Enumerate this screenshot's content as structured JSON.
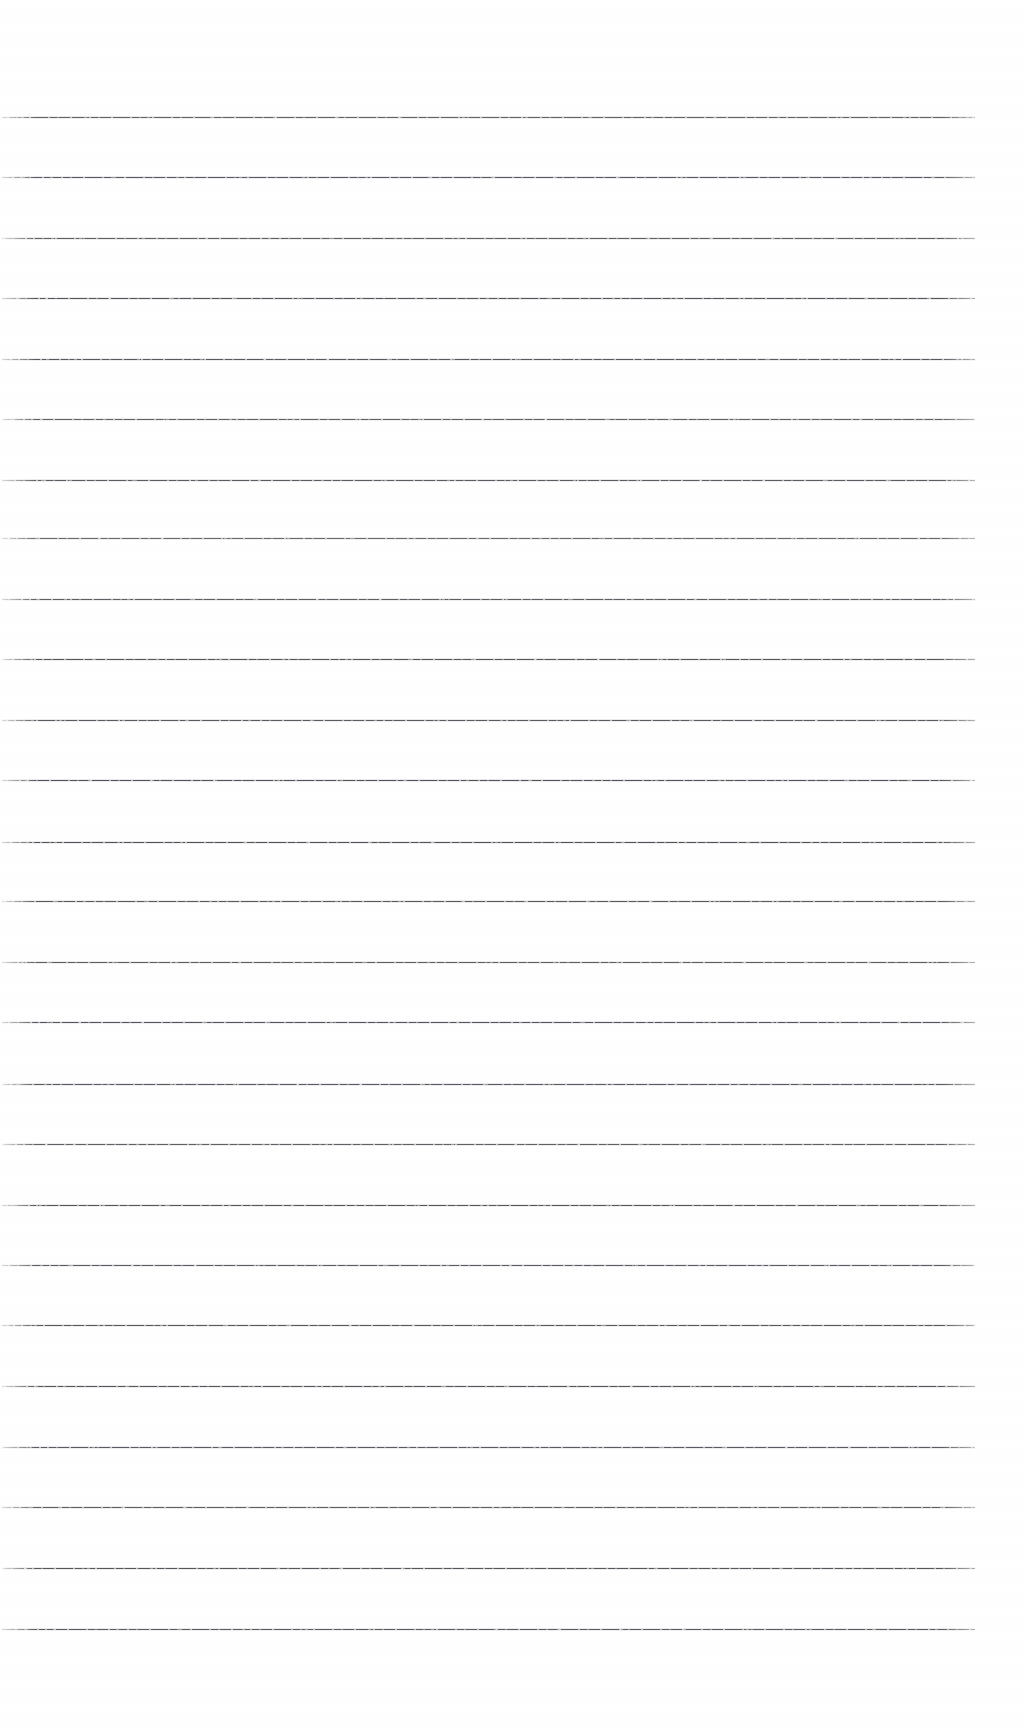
{
  "document": {
    "kind": "ruled-notebook-page",
    "content_text": "",
    "page_width": 1030,
    "page_height": 1728,
    "paper_color": "#fdfdfd",
    "rule_color": "#4d4d55"
  },
  "ruling": {
    "line_count": 26,
    "line_left_x": 2,
    "line_right_x": 975,
    "line_width": 973,
    "first_line_y": 117,
    "line_spacing": 60.5,
    "line_thickness": 1,
    "top_margin": 117,
    "bottom_margin": 99,
    "right_margin": 55,
    "left_margin": 2,
    "lines": [
      {
        "index": 1,
        "y": 117,
        "opacity": 0.88
      },
      {
        "index": 2,
        "y": 177,
        "opacity": 0.92
      },
      {
        "index": 3,
        "y": 238,
        "opacity": 0.9
      },
      {
        "index": 4,
        "y": 298,
        "opacity": 0.95
      },
      {
        "index": 5,
        "y": 359,
        "opacity": 0.93
      },
      {
        "index": 6,
        "y": 419,
        "opacity": 0.88
      },
      {
        "index": 7,
        "y": 480,
        "opacity": 0.91
      },
      {
        "index": 8,
        "y": 538,
        "opacity": 0.84
      },
      {
        "index": 9,
        "y": 599,
        "opacity": 0.9
      },
      {
        "index": 10,
        "y": 659,
        "opacity": 0.94
      },
      {
        "index": 11,
        "y": 720,
        "opacity": 0.92
      },
      {
        "index": 12,
        "y": 780,
        "opacity": 0.96
      },
      {
        "index": 13,
        "y": 842,
        "opacity": 0.97
      },
      {
        "index": 14,
        "y": 901,
        "opacity": 0.93
      },
      {
        "index": 15,
        "y": 962,
        "opacity": 0.9
      },
      {
        "index": 16,
        "y": 1022,
        "opacity": 0.95
      },
      {
        "index": 17,
        "y": 1084,
        "opacity": 0.92
      },
      {
        "index": 18,
        "y": 1144,
        "opacity": 0.89
      },
      {
        "index": 19,
        "y": 1205,
        "opacity": 0.94
      },
      {
        "index": 20,
        "y": 1265,
        "opacity": 0.91
      },
      {
        "index": 21,
        "y": 1325,
        "opacity": 0.93
      },
      {
        "index": 22,
        "y": 1386,
        "opacity": 0.95
      },
      {
        "index": 23,
        "y": 1447,
        "opacity": 0.92
      },
      {
        "index": 24,
        "y": 1507,
        "opacity": 0.9
      },
      {
        "index": 25,
        "y": 1568,
        "opacity": 0.94
      },
      {
        "index": 26,
        "y": 1629,
        "opacity": 0.91
      }
    ]
  }
}
